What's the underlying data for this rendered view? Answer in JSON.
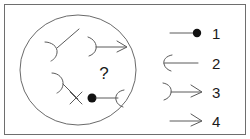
{
  "figure": {
    "title": "",
    "background_color": "#ffffff",
    "frame_color": "#6e6e6e",
    "ink_color": "#5a5a5a",
    "dot_color": "#111111",
    "unknown_marker": "?"
  },
  "diagram": {
    "region_name": "ellipse-region",
    "region_shape": "ellipse",
    "items": [
      {
        "name": "edge-hook-diagonal",
        "description": "diagonal line with hook arc at lower-left end",
        "start_symbol": "arc-hook",
        "end_symbol": "none"
      },
      {
        "name": "edge-arc-arrow",
        "description": "arc at left end, arrowhead at right end",
        "start_symbol": "arc",
        "end_symbol": "arrowhead"
      },
      {
        "name": "edge-hook-cross",
        "description": "line with hook arc at upper-left and cross mark at lower-right",
        "start_symbol": "arc-hook",
        "end_symbol": "cross"
      },
      {
        "name": "edge-dot-arc",
        "description": "filled dot at left end, line, arc at right end",
        "start_symbol": "dot",
        "end_symbol": "arc"
      }
    ]
  },
  "legend": {
    "name": "legend",
    "entries": [
      {
        "label": "1",
        "symbol": "line-with-dot",
        "description": "line terminating in a filled dot"
      },
      {
        "label": "2",
        "symbol": "c-arc-with-line",
        "description": "line beginning with a C-shaped arc opening right"
      },
      {
        "label": "3",
        "symbol": "arc-with-arrow",
        "description": "line beginning with a reversed arc and ending in an arrowhead"
      },
      {
        "label": "4",
        "symbol": "plain-arrow",
        "description": "plain line ending in an arrowhead"
      }
    ]
  }
}
